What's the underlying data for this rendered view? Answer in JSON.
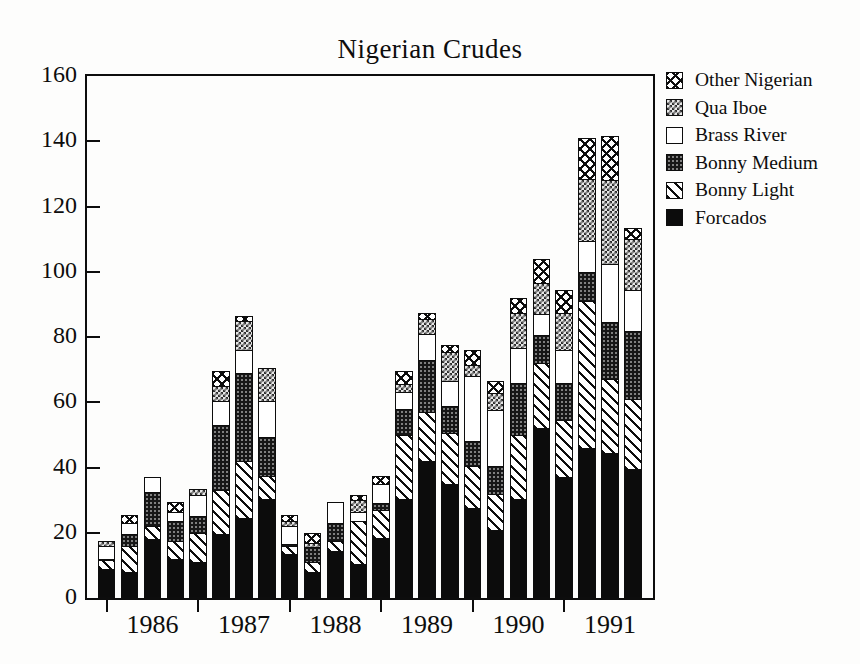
{
  "title": "Nigerian Crudes",
  "axes": {
    "y_ticks": [
      0,
      20,
      40,
      60,
      80,
      100,
      120,
      140,
      160
    ],
    "ylim": [
      0,
      160
    ],
    "x_year_labels": [
      "1986",
      "1987",
      "1988",
      "1989",
      "1990",
      "1991"
    ]
  },
  "legend": {
    "position": "top-right",
    "entries": [
      {
        "label": "Other Nigerian",
        "key": "other-nigerian"
      },
      {
        "label": "Qua Iboe",
        "key": "qua-iboe"
      },
      {
        "label": "Brass River",
        "key": "brass-river"
      },
      {
        "label": "Bonny Medium",
        "key": "bonny-medium"
      },
      {
        "label": "Bonny Light",
        "key": "bonny-light"
      },
      {
        "label": "Forcados",
        "key": "forcados"
      }
    ]
  },
  "colors": {
    "ink": "#0d0d0d",
    "background": "#fdfdfc",
    "forcados_fill": "#0c0c0c",
    "bonny_medium_fill": "#161616",
    "qua_iboe_fill": "#2e2e2e"
  },
  "chart_data": {
    "type": "bar",
    "stacked": true,
    "title": "Nigerian Crudes",
    "xlabel": "",
    "ylabel": "",
    "ylim": [
      0,
      160
    ],
    "grid": false,
    "legend_position": "top-right",
    "bars_per_year": 4,
    "categories": [
      "1986 Q1",
      "1986 Q2",
      "1986 Q3",
      "1986 Q4",
      "1987 Q1",
      "1987 Q2",
      "1987 Q3",
      "1987 Q4",
      "1988 Q1",
      "1988 Q2",
      "1988 Q3",
      "1988 Q4",
      "1989 Q1",
      "1989 Q2",
      "1989 Q3",
      "1989 Q4",
      "1990 Q1",
      "1990 Q2",
      "1990 Q3",
      "1990 Q4",
      "1991 Q1",
      "1991 Q2",
      "1991 Q3",
      "1991 Q4"
    ],
    "series": [
      {
        "name": "Forcados",
        "key": "forcados",
        "values": [
          9,
          8,
          18,
          12,
          11,
          19.5,
          24.5,
          30.5,
          13.5,
          8,
          14.5,
          10.5,
          18.5,
          30.5,
          42,
          35,
          27.5,
          21,
          30.5,
          52,
          37,
          46,
          44.5,
          39.5
        ]
      },
      {
        "name": "Bonny Light",
        "key": "bonny-light",
        "values": [
          2.5,
          8,
          4,
          5.5,
          9,
          13.5,
          17.5,
          7,
          2.5,
          3,
          3,
          13,
          8.5,
          19.5,
          15,
          15.5,
          13,
          11,
          19.5,
          20,
          17.5,
          45,
          22.5,
          21.5
        ]
      },
      {
        "name": "Bonny Medium",
        "key": "bonny-medium",
        "values": [
          0.5,
          3.5,
          10.5,
          6,
          5,
          20,
          27,
          12,
          0.5,
          4.5,
          5.5,
          0,
          2,
          8,
          16,
          8.5,
          7.5,
          8.5,
          16,
          8.5,
          11.5,
          9,
          17.5,
          21
        ]
      },
      {
        "name": "Brass River",
        "key": "brass-river",
        "values": [
          4,
          3.5,
          4.5,
          3,
          6.5,
          7.5,
          7,
          11,
          5.5,
          0,
          6.5,
          3,
          6,
          5,
          8,
          7.5,
          20,
          17,
          10.5,
          6.5,
          10,
          9.5,
          18,
          12.5
        ]
      },
      {
        "name": "Qua Iboe",
        "key": "qua-iboe",
        "values": [
          1.5,
          0,
          0,
          0,
          2,
          4.5,
          9,
          10,
          1.5,
          1.5,
          0,
          3.5,
          0,
          2.5,
          4.5,
          9,
          3.5,
          5.5,
          11,
          9.5,
          11.5,
          19,
          25.5,
          15.5
        ]
      },
      {
        "name": "Other Nigerian",
        "key": "other-nigerian",
        "values": [
          0,
          2.5,
          0,
          3,
          0,
          4.5,
          1.5,
          0,
          2,
          3,
          0,
          1.5,
          2.5,
          4,
          2,
          2,
          4.5,
          3.5,
          4.5,
          7.5,
          7,
          12.5,
          13.5,
          3.5
        ]
      }
    ],
    "totals": [
      17.5,
      25.5,
      37,
      29.5,
      33.5,
      69.5,
      86.5,
      70.5,
      25.5,
      20,
      29.5,
      31.5,
      37.5,
      69.5,
      87.5,
      77.5,
      76,
      66.5,
      92,
      104,
      94.5,
      141,
      141.5,
      113.5
    ]
  }
}
